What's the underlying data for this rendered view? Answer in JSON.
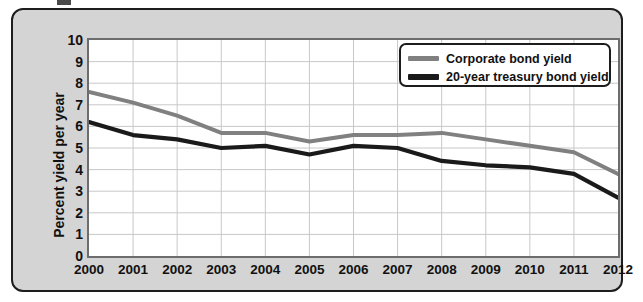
{
  "chart_data": {
    "type": "line",
    "title": "",
    "xlabel": "",
    "ylabel": "Percent yield per year",
    "categories": [
      "2000",
      "2001",
      "2002",
      "2003",
      "2004",
      "2005",
      "2006",
      "2007",
      "2008",
      "2009",
      "2010",
      "2011",
      "2012"
    ],
    "x": [
      2000,
      2001,
      2002,
      2003,
      2004,
      2005,
      2006,
      2007,
      2008,
      2009,
      2010,
      2011,
      2012
    ],
    "ylim": [
      0,
      10
    ],
    "yticks": [
      "0",
      "1",
      "2",
      "3",
      "4",
      "5",
      "6",
      "7",
      "8",
      "9",
      "10"
    ],
    "grid": true,
    "legend_position": "top-right",
    "series": [
      {
        "name": "Corporate bond yield",
        "color": "#808080",
        "values": [
          7.6,
          7.1,
          6.5,
          5.7,
          5.7,
          5.3,
          5.6,
          5.6,
          5.7,
          5.4,
          5.1,
          4.8,
          3.8
        ]
      },
      {
        "name": "20-year treasury bond yield",
        "color": "#1a1a1a",
        "values": [
          6.2,
          5.6,
          5.4,
          5.0,
          5.1,
          4.7,
          5.1,
          5.0,
          4.4,
          4.2,
          4.1,
          3.8,
          2.7
        ]
      }
    ]
  },
  "style": {
    "panel_background": "#d4d4d4",
    "plot_background": "#ffffff",
    "grid_color": "#c8c8c8",
    "frame_color": "#6d6d6d",
    "border_color": "#1d1d1d"
  }
}
